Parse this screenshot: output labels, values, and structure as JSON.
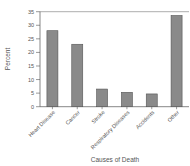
{
  "chart_data": {
    "type": "bar",
    "title": "",
    "xlabel": "Causes of Death",
    "ylabel": "Percent",
    "categories": [
      "Heart Disease",
      "Cancer",
      "Stroke",
      "Respiratory Diseases",
      "Accidents",
      "Other"
    ],
    "values": [
      28,
      23,
      6.5,
      5.3,
      4.7,
      33.6
    ],
    "ylim": [
      0,
      35
    ],
    "yticks": [
      0,
      5,
      10,
      15,
      20,
      25,
      30,
      35
    ],
    "grid": false,
    "legend": null,
    "bar_color": "#8a8a8a",
    "bar_edge_color": "#555555"
  }
}
